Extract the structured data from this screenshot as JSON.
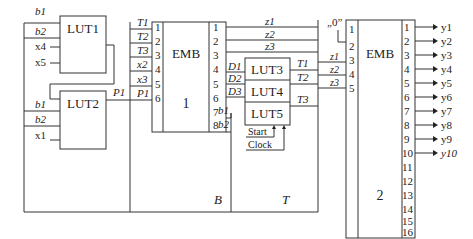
{
  "diagram": {
    "blocks": {
      "lut1": {
        "label": "LUT1",
        "inputs": [
          "b1",
          "b2",
          "x4",
          "x5"
        ]
      },
      "lut2": {
        "label": "LUT2",
        "inputs": [
          "b1",
          "b2",
          "x1"
        ],
        "output": "P1"
      },
      "emb1": {
        "label": "EMB",
        "number": "1",
        "left_pins": [
          "1",
          "2",
          "3",
          "4",
          "5",
          "6"
        ],
        "left_signals": [
          "T1",
          "T2",
          "T3",
          "x2",
          "x3",
          "P1"
        ],
        "right_pins": [
          "1",
          "2",
          "3",
          "4",
          "5",
          "6",
          "7",
          "8"
        ],
        "right_signals": [
          "z1",
          "z2",
          "z3",
          "D1",
          "D2",
          "D3",
          "b1",
          "b2"
        ]
      },
      "lut3": {
        "label": "LUT3"
      },
      "lut4": {
        "label": "LUT4"
      },
      "lut5": {
        "label": "LUT5"
      },
      "lut_inputs": [
        "D1",
        "D2",
        "D3"
      ],
      "lut_outputs": [
        "T1",
        "T2",
        "T3"
      ],
      "control": {
        "start": "Start",
        "clock": "Clock"
      },
      "emb2": {
        "label": "EMB",
        "number": "2",
        "constant": "„0”",
        "left_pins": [
          "1",
          "2",
          "3",
          "4",
          "5"
        ],
        "left_signals": [
          "z1",
          "z2",
          "z3"
        ],
        "right_pins": [
          "1",
          "2",
          "3",
          "4",
          "5",
          "6",
          "7",
          "8",
          "9",
          "10",
          "11",
          "12",
          "13",
          "14",
          "15",
          "16"
        ],
        "outputs": [
          "y1",
          "y2",
          "y3",
          "y4",
          "y5",
          "y6",
          "y7",
          "y8",
          "y9",
          "y10"
        ]
      }
    },
    "regions": {
      "b": "B",
      "t": "T"
    },
    "buses": {
      "z": [
        "z1",
        "z2",
        "z3"
      ]
    }
  }
}
